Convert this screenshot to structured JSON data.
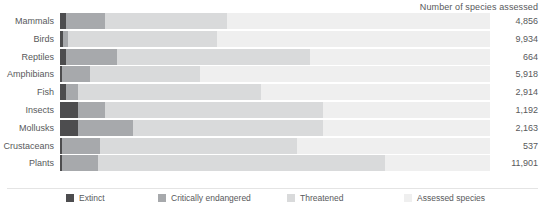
{
  "header": {
    "title": "Number of species assessed"
  },
  "legend": {
    "items": [
      {
        "label": "Extinct",
        "color": "#4d4d4f",
        "name": "legend-extinct"
      },
      {
        "label": "Critically endangered",
        "color": "#a7a9ac",
        "name": "legend-critically-endangered"
      },
      {
        "label": "Threatened",
        "color": "#d9dadb",
        "name": "legend-threatened"
      },
      {
        "label": "Assessed species",
        "color": "#efefef",
        "name": "legend-assessed-species"
      }
    ]
  },
  "chart_data": {
    "type": "bar",
    "orientation": "horizontal",
    "stacked": true,
    "title": "Number of species assessed",
    "xlabel": "",
    "ylabel": "",
    "grid": false,
    "legend_position": "bottom",
    "categories": [
      "Mammals",
      "Birds",
      "Reptiles",
      "Amphibians",
      "Fish",
      "Insects",
      "Mollusks",
      "Crustaceans",
      "Plants"
    ],
    "totals": [
      "4,856",
      "9,934",
      "664",
      "5,918",
      "2,914",
      "1,192",
      "2,163",
      "537",
      "11,901"
    ],
    "series": [
      {
        "name": "Extinct",
        "color": "#4d4d4f",
        "widths_px": [
          6,
          3,
          6,
          2,
          6,
          18,
          18,
          2,
          2
        ]
      },
      {
        "name": "Critically endangered",
        "color": "#a7a9ac",
        "widths_px": [
          39,
          5,
          51,
          28,
          12,
          27,
          55,
          38,
          36
        ]
      },
      {
        "name": "Threatened",
        "color": "#d9dadb",
        "widths_px": [
          122,
          149,
          193,
          110,
          183,
          218,
          190,
          197,
          287
        ]
      },
      {
        "name": "Assessed species",
        "color": "#efefef",
        "widths_px": [
          263,
          273,
          180,
          290,
          229,
          167,
          167,
          193,
          105
        ]
      }
    ]
  }
}
